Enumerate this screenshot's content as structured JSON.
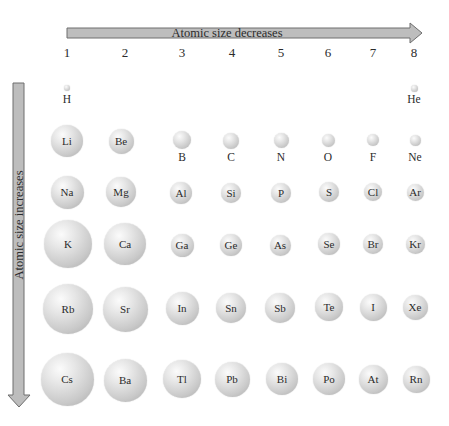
{
  "diagram": {
    "horizontal_arrow_label": "Atomic size decreases",
    "vertical_arrow_label": "Atomic size increases",
    "arrow_fill": "#bdbdbd",
    "arrow_stroke": "#6e6e6e",
    "groups": [
      {
        "label": "1",
        "x": 67
      },
      {
        "label": "2",
        "x": 125
      },
      {
        "label": "3",
        "x": 182
      },
      {
        "label": "4",
        "x": 232
      },
      {
        "label": "5",
        "x": 281
      },
      {
        "label": "6",
        "x": 328
      },
      {
        "label": "7",
        "x": 373
      },
      {
        "label": "8",
        "x": 414
      }
    ],
    "atoms": [
      {
        "symbol": "H",
        "x": 67,
        "y": 88,
        "d": 6,
        "label": "below",
        "label_y": 94
      },
      {
        "symbol": "He",
        "x": 414,
        "y": 88,
        "d": 7,
        "label": "below",
        "label_y": 94
      },
      {
        "symbol": "Li",
        "x": 67,
        "y": 141,
        "d": 32,
        "label": "inside"
      },
      {
        "symbol": "Be",
        "x": 121,
        "y": 141,
        "d": 25,
        "label": "inside"
      },
      {
        "symbol": "B",
        "x": 182,
        "y": 140,
        "d": 18,
        "label": "below",
        "label_y": 152
      },
      {
        "symbol": "C",
        "x": 231,
        "y": 141,
        "d": 16,
        "label": "below",
        "label_y": 152
      },
      {
        "symbol": "N",
        "x": 281,
        "y": 140,
        "d": 15,
        "label": "below",
        "label_y": 152
      },
      {
        "symbol": "O",
        "x": 328,
        "y": 140,
        "d": 13,
        "label": "below",
        "label_y": 152
      },
      {
        "symbol": "F",
        "x": 373,
        "y": 140,
        "d": 12,
        "label": "below",
        "label_y": 152
      },
      {
        "symbol": "Ne",
        "x": 415,
        "y": 140,
        "d": 11,
        "label": "below",
        "label_y": 152
      },
      {
        "symbol": "Na",
        "x": 67,
        "y": 192,
        "d": 33,
        "label": "inside"
      },
      {
        "symbol": "Mg",
        "x": 121,
        "y": 192,
        "d": 30,
        "label": "inside"
      },
      {
        "symbol": "Al",
        "x": 181,
        "y": 193,
        "d": 22,
        "label": "inside"
      },
      {
        "symbol": "Si",
        "x": 231,
        "y": 193,
        "d": 20,
        "label": "inside"
      },
      {
        "symbol": "P",
        "x": 281,
        "y": 193,
        "d": 20,
        "label": "inside"
      },
      {
        "symbol": "S",
        "x": 329,
        "y": 192,
        "d": 20,
        "label": "inside"
      },
      {
        "symbol": "Cl",
        "x": 373,
        "y": 192,
        "d": 18,
        "label": "inside"
      },
      {
        "symbol": "Ar",
        "x": 415,
        "y": 192,
        "d": 17,
        "label": "inside"
      },
      {
        "symbol": "K",
        "x": 68,
        "y": 244,
        "d": 48,
        "label": "inside"
      },
      {
        "symbol": "Ca",
        "x": 125,
        "y": 244,
        "d": 42,
        "label": "inside"
      },
      {
        "symbol": "Ga",
        "x": 182,
        "y": 245,
        "d": 23,
        "label": "inside"
      },
      {
        "symbol": "Ge",
        "x": 231,
        "y": 245,
        "d": 22,
        "label": "inside"
      },
      {
        "symbol": "As",
        "x": 280,
        "y": 245,
        "d": 21,
        "label": "inside"
      },
      {
        "symbol": "Se",
        "x": 329,
        "y": 244,
        "d": 22,
        "label": "inside"
      },
      {
        "symbol": "Br",
        "x": 373,
        "y": 244,
        "d": 20,
        "label": "inside"
      },
      {
        "symbol": "Kr",
        "x": 415,
        "y": 244,
        "d": 19,
        "label": "inside"
      },
      {
        "symbol": "Rb",
        "x": 68,
        "y": 309,
        "d": 50,
        "label": "inside"
      },
      {
        "symbol": "Sr",
        "x": 125,
        "y": 309,
        "d": 45,
        "label": "inside"
      },
      {
        "symbol": "In",
        "x": 182,
        "y": 308,
        "d": 33,
        "label": "inside"
      },
      {
        "symbol": "Sn",
        "x": 231,
        "y": 308,
        "d": 30,
        "label": "inside"
      },
      {
        "symbol": "Sb",
        "x": 280,
        "y": 308,
        "d": 30,
        "label": "inside"
      },
      {
        "symbol": "Te",
        "x": 329,
        "y": 307,
        "d": 28,
        "label": "inside"
      },
      {
        "symbol": "I",
        "x": 373,
        "y": 307,
        "d": 27,
        "label": "inside"
      },
      {
        "symbol": "Xe",
        "x": 415,
        "y": 307,
        "d": 25,
        "label": "inside"
      },
      {
        "symbol": "Cs",
        "x": 67,
        "y": 379,
        "d": 53,
        "label": "inside"
      },
      {
        "symbol": "Ba",
        "x": 125,
        "y": 380,
        "d": 43,
        "label": "inside"
      },
      {
        "symbol": "Tl",
        "x": 182,
        "y": 379,
        "d": 38,
        "label": "inside"
      },
      {
        "symbol": "Pb",
        "x": 232,
        "y": 379,
        "d": 35,
        "label": "inside"
      },
      {
        "symbol": "Bi",
        "x": 282,
        "y": 379,
        "d": 32,
        "label": "inside"
      },
      {
        "symbol": "Po",
        "x": 329,
        "y": 379,
        "d": 32,
        "label": "inside"
      },
      {
        "symbol": "At",
        "x": 373,
        "y": 379,
        "d": 29,
        "label": "inside"
      },
      {
        "symbol": "Rn",
        "x": 416,
        "y": 379,
        "d": 27,
        "label": "inside"
      }
    ]
  }
}
